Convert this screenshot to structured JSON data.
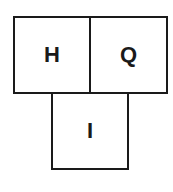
{
  "diagram": {
    "type": "cell-grid",
    "stroke_color": "#1a1a1a",
    "background": "#ffffff",
    "cells": [
      {
        "id": "h",
        "label": "H",
        "row": 0,
        "col": 0
      },
      {
        "id": "q",
        "label": "Q",
        "row": 0,
        "col": 1
      },
      {
        "id": "i",
        "label": "I",
        "row": 1,
        "col": 0.5
      }
    ]
  }
}
